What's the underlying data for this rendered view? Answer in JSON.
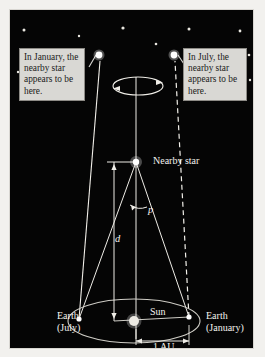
{
  "figure": {
    "background_color": "#050505",
    "frame_color": "#d8d6d1"
  },
  "callouts": [
    {
      "id": "january",
      "text": "In January, the nearby star appears to be here.",
      "points_to": "star-january",
      "bg": "#d9d8d4"
    },
    {
      "id": "july",
      "text": "In July, the nearby star appears to be here.",
      "points_to": "star-july",
      "bg": "#d9d8d4"
    }
  ],
  "labels": {
    "nearby_star": "Nearby star",
    "sun": "Sun",
    "earth_july": "Earth (July)",
    "earth_january": "Earth (January)",
    "distance": "d",
    "parallax_angle": "p",
    "baseline": "1 AU"
  },
  "objects": {
    "nearby_star": {
      "x": 135,
      "y": 152,
      "r": 4.5,
      "color": "#ffffff"
    },
    "sun": {
      "x": 133,
      "y": 311,
      "r": 6,
      "color": "#e8e6df"
    },
    "earth_july": {
      "x": 78,
      "y": 309,
      "color": "#ffffff"
    },
    "earth_january": {
      "x": 188,
      "y": 307,
      "color": "#ffffff"
    },
    "apparent_star_january": {
      "x": 98,
      "y": 45,
      "r": 5,
      "color": "#ffffff"
    },
    "apparent_star_july": {
      "x": 173,
      "y": 45,
      "r": 5,
      "color": "#ffffff"
    }
  },
  "background_stars": [
    {
      "x": 23,
      "y": 20,
      "r": 1.5
    },
    {
      "x": 78,
      "y": 26,
      "r": 1.2
    },
    {
      "x": 122,
      "y": 18,
      "r": 1.6
    },
    {
      "x": 188,
      "y": 19,
      "r": 1.5
    },
    {
      "x": 239,
      "y": 21,
      "r": 1.4
    },
    {
      "x": 45,
      "y": 44,
      "r": 1.5
    },
    {
      "x": 155,
      "y": 34,
      "r": 1.3
    },
    {
      "x": 215,
      "y": 44,
      "r": 1.5
    },
    {
      "x": 248,
      "y": 45,
      "r": 1.3
    },
    {
      "x": 17,
      "y": 62,
      "r": 1.2
    },
    {
      "x": 249,
      "y": 70,
      "r": 1.2
    }
  ],
  "apparent_motion_ellipse": {
    "cx": 137,
    "cy": 76,
    "rx": 25,
    "ry": 9,
    "note": "apparent elliptical path of star with direction arrows"
  },
  "earth_orbit_ellipse": {
    "cx": 133,
    "cy": 311,
    "rx": 66,
    "ry": 22
  },
  "sight_lines": [
    {
      "from": "earth-july",
      "to": "star-january",
      "style": "solid"
    },
    {
      "from": "earth-january",
      "to": "star-july",
      "style": "dashed"
    }
  ],
  "measurements": {
    "distance_line": {
      "x": 113,
      "y_top": 152,
      "y_bottom": 311,
      "label": "d"
    },
    "baseline_line": {
      "y": 338,
      "x_left": 133,
      "x_right": 188,
      "label": "1 AU"
    }
  }
}
